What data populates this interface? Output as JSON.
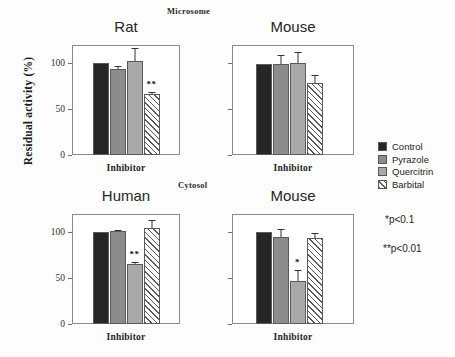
{
  "figure": {
    "y_axis_label": "Residual activity (%)",
    "sections": [
      {
        "id": "microsome",
        "label": "Microsome"
      },
      {
        "id": "cytosol",
        "label": "Cytosol"
      }
    ],
    "x_axis_label": "Inhibitor",
    "y_ticks": [
      "0",
      "50",
      "100"
    ]
  },
  "legend": {
    "items": [
      {
        "label": "Control",
        "swatch": "solid-dark-fill",
        "color": "#262626"
      },
      {
        "label": "Pyrazole",
        "swatch": "medium-gray-fill",
        "color": "#8c8c8c"
      },
      {
        "label": "Quercitrin",
        "swatch": "light-gray-stipple",
        "color": "#a9a9a9"
      },
      {
        "label": "Barbital",
        "swatch": "diagonal-hatch",
        "color": "#ffffff"
      }
    ]
  },
  "annotations": {
    "p_one_star": "*p<0.1",
    "p_two_star": "**p<0.01"
  },
  "panels": [
    {
      "id": "rat-microsome",
      "title": "Rat",
      "section": "Microsome",
      "show_y_labels": true
    },
    {
      "id": "mouse-microsome",
      "title": "Mouse",
      "section": "Microsome",
      "show_y_labels": false
    },
    {
      "id": "human-cytosol",
      "title": "Human",
      "section": "Cytosol",
      "show_y_labels": true
    },
    {
      "id": "mouse-cytosol",
      "title": "Mouse",
      "section": "Cytosol",
      "show_y_labels": false
    }
  ],
  "chart_data": [
    {
      "type": "bar",
      "title": "Rat",
      "subtitle": "Microsome",
      "xlabel": "Inhibitor",
      "ylabel": "Residual activity (%)",
      "ylim": [
        0,
        120
      ],
      "yticks": [
        0,
        50,
        100
      ],
      "grid": false,
      "legend_position": "right-outside",
      "categories": [
        "Control",
        "Pyrazole",
        "Quercitrin",
        "Barbital"
      ],
      "values": [
        100,
        94,
        103,
        67
      ],
      "errors": [
        0,
        3,
        14,
        2
      ],
      "significance": [
        "",
        "",
        "",
        "**"
      ]
    },
    {
      "type": "bar",
      "title": "Mouse",
      "subtitle": "Microsome",
      "xlabel": "Inhibitor",
      "ylabel": "Residual activity (%)",
      "ylim": [
        0,
        120
      ],
      "yticks": [
        0,
        50,
        100
      ],
      "grid": false,
      "legend_position": "right-outside",
      "categories": [
        "Control",
        "Pyrazole",
        "Quercitrin",
        "Barbital"
      ],
      "values": [
        99,
        99,
        100,
        79
      ],
      "errors": [
        0,
        10,
        12,
        8
      ],
      "significance": [
        "",
        "",
        "",
        ""
      ]
    },
    {
      "type": "bar",
      "title": "Human",
      "subtitle": "Cytosol",
      "xlabel": "Inhibitor",
      "ylabel": "Residual activity (%)",
      "ylim": [
        0,
        120
      ],
      "yticks": [
        0,
        50,
        100
      ],
      "grid": false,
      "legend_position": "right-outside",
      "categories": [
        "Control",
        "Pyrazole",
        "Quercitrin",
        "Barbital"
      ],
      "values": [
        100,
        101,
        65,
        105
      ],
      "errors": [
        0,
        2,
        3,
        8
      ],
      "significance": [
        "",
        "",
        "**",
        ""
      ]
    },
    {
      "type": "bar",
      "title": "Mouse",
      "subtitle": "Cytosol",
      "xlabel": "Inhibitor",
      "ylabel": "Residual activity (%)",
      "ylim": [
        0,
        120
      ],
      "yticks": [
        0,
        50,
        100
      ],
      "grid": false,
      "legend_position": "right-outside",
      "categories": [
        "Control",
        "Pyrazole",
        "Quercitrin",
        "Barbital"
      ],
      "values": [
        100,
        95,
        47,
        94
      ],
      "errors": [
        0,
        9,
        12,
        5
      ],
      "significance": [
        "",
        "",
        "*",
        ""
      ]
    }
  ]
}
